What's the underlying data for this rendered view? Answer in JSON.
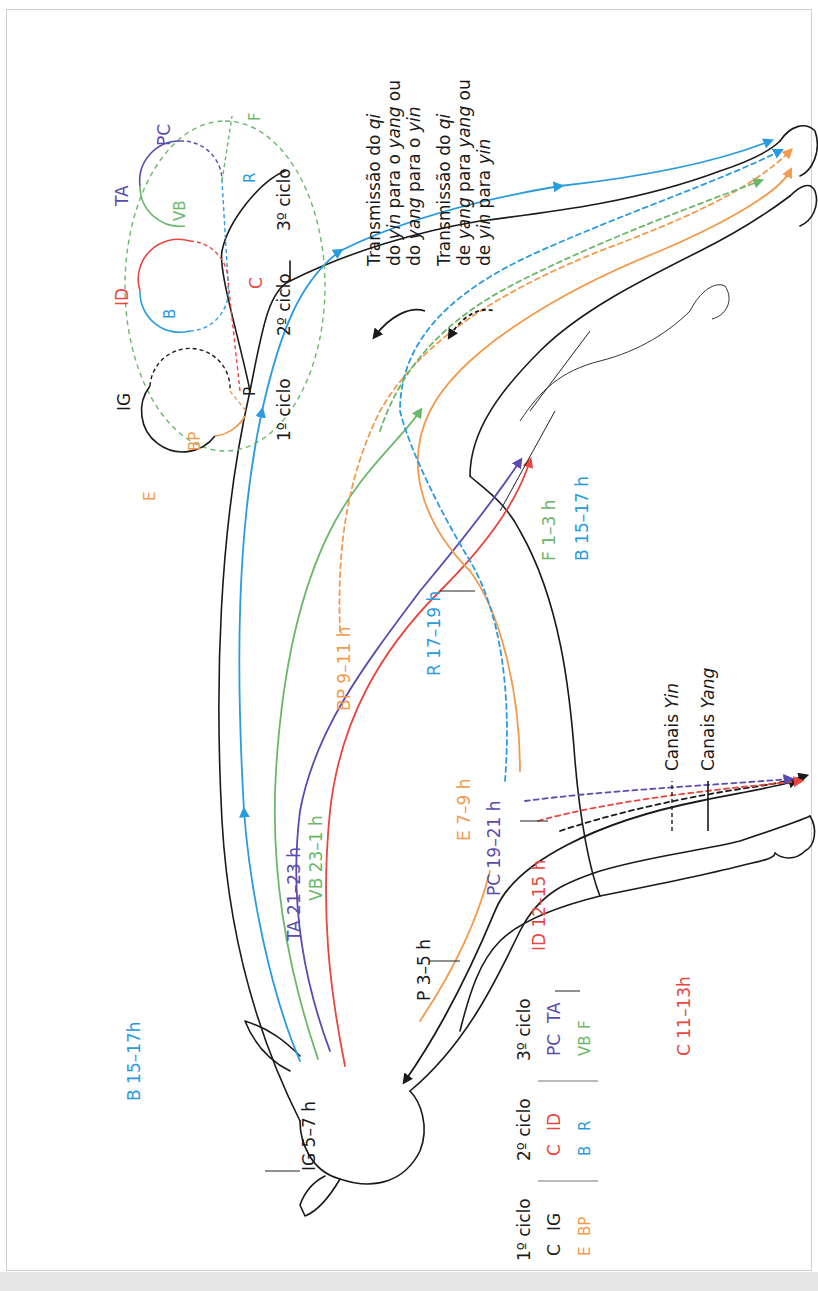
{
  "colors": {
    "C": "#e8463f",
    "ID": "#e8463f",
    "IG": "#1a1a1a",
    "P": "#1a1a1a",
    "E": "#f39a4d",
    "BP": "#f39a4d",
    "B": "#2b9be0",
    "R": "#2b9be0",
    "TA": "#5a4bb0",
    "PC": "#5a4bb0",
    "VB": "#6bb86b",
    "F": "#6bb86b",
    "border": "#cfcfcf",
    "bottom_strip": "#e6e6e6"
  },
  "cycles_diagram": {
    "cycle1": {
      "label": "1º ciclo",
      "nodes": [
        "IG",
        "P",
        "BP",
        "E"
      ]
    },
    "cycle2": {
      "label": "2º ciclo",
      "nodes": [
        "ID",
        "B",
        "C"
      ]
    },
    "cycle3": {
      "label": "3º ciclo",
      "nodes": [
        "TA",
        "VB",
        "PC",
        "R",
        "F"
      ]
    }
  },
  "transmission_legend": {
    "solid": {
      "line1_a": "Transmissão do ",
      "line1_b": "qi",
      "line2_a": "do ",
      "line2_b": "yin",
      "line2_c": " para o ",
      "line2_d": "yang",
      "line2_e": " ou",
      "line3_a": "do ",
      "line3_b": "yang",
      "line3_c": " para o ",
      "line3_d": "yin"
    },
    "dashed": {
      "line1_a": "Transmissão do ",
      "line1_b": "qi",
      "line2_a": "de ",
      "line2_b": "yang",
      "line2_c": " para ",
      "line2_d": "yang",
      "line2_e": " ou",
      "line3_a": "de ",
      "line3_b": "yin",
      "line3_c": " para ",
      "line3_d": "yin"
    }
  },
  "channel_labels": {
    "B_back": "B 15–17h",
    "TA": "TA 21–23 h",
    "VB": "VB 23–1 h",
    "BP": "BP 9–11 h",
    "R": "R 17–19 h",
    "E": "E 7–9 h",
    "PC": "PC 19–21 h",
    "ID": "ID 12–15 h",
    "C": "C 11–13h",
    "F": "F 1–3 h",
    "B_hind": "B 15–17 h",
    "P": "P 3–5 h",
    "IG": "IG 5–7 h"
  },
  "line_legend": {
    "yin_a": "Canais ",
    "yin_b": "Yin",
    "yang_a": "Canais ",
    "yang_b": "Yang"
  },
  "cycle_table": {
    "headers": [
      "1º ciclo",
      "2º ciclo",
      "3º ciclo"
    ],
    "row1": [
      [
        "C",
        "IG"
      ],
      [
        "C",
        "ID"
      ],
      [
        "PC",
        "TA"
      ]
    ],
    "row2": [
      [
        "E",
        "BP"
      ],
      [
        "B",
        "R"
      ],
      [
        "VB",
        "F"
      ]
    ]
  }
}
